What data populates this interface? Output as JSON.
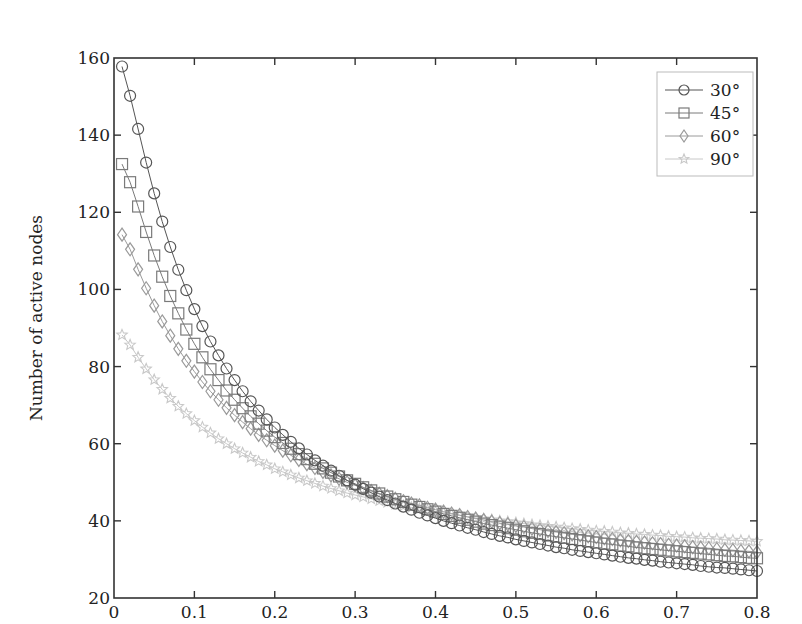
{
  "chart_data": {
    "type": "line",
    "title": "",
    "xlabel": "",
    "ylabel": "Number of active nodes",
    "xlim": [
      0,
      0.8
    ],
    "ylim": [
      20,
      160
    ],
    "xticks": [
      "0",
      "0.1",
      "0.2",
      "0.3",
      "0.4",
      "0.5",
      "0.6",
      "0.7",
      "0.8"
    ],
    "yticks": [
      "20",
      "40",
      "60",
      "80",
      "100",
      "120",
      "140",
      "160"
    ],
    "grid": false,
    "legend_position": "upper right",
    "x": [
      0.01,
      0.02,
      0.03,
      0.04,
      0.05,
      0.06,
      0.07,
      0.08,
      0.09,
      0.1,
      0.11,
      0.12,
      0.13,
      0.14,
      0.15,
      0.16,
      0.17,
      0.18,
      0.19,
      0.2,
      0.21,
      0.22,
      0.23,
      0.24,
      0.25,
      0.26,
      0.27,
      0.28,
      0.29,
      0.3,
      0.31,
      0.32,
      0.33,
      0.34,
      0.35,
      0.36,
      0.37,
      0.38,
      0.39,
      0.4,
      0.41,
      0.42,
      0.43,
      0.44,
      0.45,
      0.46,
      0.47,
      0.48,
      0.49,
      0.5,
      0.51,
      0.52,
      0.53,
      0.54,
      0.55,
      0.56,
      0.57,
      0.58,
      0.59,
      0.6,
      0.61,
      0.62,
      0.63,
      0.64,
      0.65,
      0.66,
      0.67,
      0.68,
      0.69,
      0.7,
      0.71,
      0.72,
      0.73,
      0.74,
      0.75,
      0.76,
      0.77,
      0.78,
      0.79,
      0.8
    ],
    "series": [
      {
        "name": "30°",
        "marker": "circle",
        "color": "#555555",
        "values": [
          157.8,
          150.2,
          141.6,
          132.9,
          124.9,
          117.6,
          111.0,
          105.1,
          99.8,
          94.9,
          90.5,
          86.5,
          82.9,
          79.5,
          76.5,
          73.6,
          71.0,
          68.6,
          66.3,
          64.2,
          62.3,
          60.5,
          58.8,
          57.2,
          55.7,
          54.3,
          53.0,
          51.7,
          50.5,
          49.4,
          48.3,
          47.3,
          46.3,
          45.4,
          44.5,
          43.7,
          42.9,
          42.1,
          41.4,
          40.7,
          40.0,
          39.4,
          38.8,
          38.2,
          37.7,
          37.1,
          36.6,
          36.1,
          35.7,
          35.2,
          34.8,
          34.4,
          34.0,
          33.6,
          33.2,
          32.9,
          32.5,
          32.2,
          31.9,
          31.6,
          31.3,
          31.0,
          30.7,
          30.4,
          30.2,
          29.9,
          29.7,
          29.4,
          29.2,
          29.0,
          28.8,
          28.6,
          28.3,
          28.1,
          27.9,
          27.8,
          27.6,
          27.4,
          27.2,
          27.0
        ]
      },
      {
        "name": "45°",
        "marker": "square",
        "color": "#7a7a7a",
        "values": [
          132.5,
          127.8,
          121.5,
          114.9,
          108.8,
          103.3,
          98.3,
          93.8,
          89.6,
          85.9,
          82.4,
          79.3,
          76.5,
          73.8,
          71.4,
          69.2,
          67.1,
          65.2,
          63.4,
          61.7,
          60.2,
          58.7,
          57.3,
          56.0,
          54.8,
          53.6,
          52.5,
          51.5,
          50.5,
          49.6,
          48.7,
          47.9,
          47.1,
          46.3,
          45.6,
          44.9,
          44.2,
          43.6,
          43.0,
          42.4,
          41.8,
          41.3,
          40.8,
          40.3,
          39.8,
          39.3,
          38.9,
          38.5,
          38.1,
          37.7,
          37.3,
          36.9,
          36.6,
          36.2,
          35.9,
          35.6,
          35.3,
          35.0,
          34.7,
          34.4,
          34.1,
          33.9,
          33.6,
          33.4,
          33.1,
          32.9,
          32.7,
          32.5,
          32.3,
          32.1,
          31.9,
          31.7,
          31.5,
          31.3,
          31.1,
          30.9,
          30.8,
          30.6,
          30.4,
          30.3
        ]
      },
      {
        "name": "60°",
        "marker": "diamond",
        "color": "#9a9a9a",
        "values": [
          114.2,
          110.4,
          105.2,
          100.3,
          95.8,
          91.7,
          88.0,
          84.6,
          81.5,
          78.7,
          76.0,
          73.6,
          71.4,
          69.3,
          67.4,
          65.6,
          63.9,
          62.3,
          60.9,
          59.5,
          58.2,
          57.0,
          55.8,
          54.7,
          53.7,
          52.7,
          51.8,
          50.9,
          50.0,
          49.2,
          48.5,
          47.7,
          47.0,
          46.4,
          45.7,
          45.1,
          44.5,
          44.0,
          43.4,
          42.9,
          42.4,
          41.9,
          41.5,
          41.0,
          40.6,
          40.2,
          39.8,
          39.4,
          39.1,
          38.7,
          38.4,
          38.0,
          37.7,
          37.4,
          37.1,
          36.8,
          36.5,
          36.3,
          36.0,
          35.8,
          35.5,
          35.3,
          35.0,
          34.8,
          34.6,
          34.4,
          34.2,
          34.0,
          33.8,
          33.6,
          33.4,
          33.2,
          33.0,
          32.9,
          32.7,
          32.5,
          32.4,
          32.2,
          32.1,
          31.9
        ]
      },
      {
        "name": "90°",
        "marker": "star",
        "color": "#c8c8c8",
        "values": [
          88.2,
          85.6,
          82.4,
          79.4,
          76.6,
          74.1,
          71.8,
          69.7,
          67.8,
          66.0,
          64.3,
          62.8,
          61.3,
          60.0,
          58.7,
          57.6,
          56.5,
          55.4,
          54.5,
          53.5,
          52.7,
          51.9,
          51.1,
          50.4,
          49.7,
          49.0,
          48.4,
          47.8,
          47.2,
          46.7,
          46.2,
          45.7,
          45.2,
          44.8,
          44.3,
          43.9,
          43.5,
          43.1,
          42.8,
          42.4,
          42.1,
          41.7,
          41.4,
          41.1,
          40.8,
          40.5,
          40.3,
          40.0,
          39.8,
          39.5,
          39.3,
          39.0,
          38.8,
          38.6,
          38.4,
          38.2,
          38.0,
          37.8,
          37.6,
          37.4,
          37.3,
          37.1,
          36.9,
          36.8,
          36.6,
          36.5,
          36.3,
          36.2,
          36.0,
          35.9,
          35.8,
          35.6,
          35.5,
          35.4,
          35.3,
          35.1,
          35.0,
          34.9,
          34.8,
          34.7
        ]
      }
    ]
  }
}
